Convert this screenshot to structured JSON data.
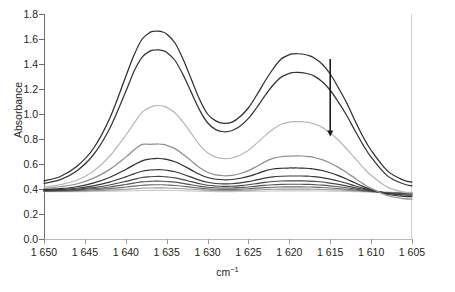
{
  "chart_data": {
    "type": "line",
    "title": "",
    "xlabel": "cm−1",
    "ylabel": "Absorbance",
    "xlim": [
      1650,
      1605
    ],
    "ylim": [
      0.0,
      1.8
    ],
    "x_reversed": true,
    "grid": false,
    "legend": null,
    "x_ticks": [
      1650,
      1645,
      1640,
      1635,
      1630,
      1625,
      1620,
      1615,
      1610,
      1605
    ],
    "x_tick_labels": [
      "1 650",
      "1 645",
      "1 640",
      "1 635",
      "1 630",
      "1 625",
      "1 620",
      "1 615",
      "1 610",
      "1 605"
    ],
    "y_ticks": [
      0.0,
      0.2,
      0.4,
      0.6,
      0.8,
      1.0,
      1.2,
      1.4,
      1.6,
      1.8
    ],
    "y_tick_labels": [
      "0.0",
      "0.2",
      "0.4",
      "0.6",
      "0.8",
      "1.0",
      "1.2",
      "1.4",
      "1.6",
      "1.8"
    ],
    "peak1_cm": 1636,
    "peak2_cm": 1618.5,
    "annotations": [
      {
        "name": "decreasing-arrow",
        "kind": "arrow",
        "x_cm": 1615.0,
        "y_from": 1.44,
        "y_to": 0.82,
        "direction": "down",
        "color": "#1a1a1a"
      }
    ],
    "x": [
      1650,
      1648,
      1646,
      1644,
      1642,
      1640,
      1639,
      1638,
      1637,
      1636.5,
      1636,
      1635.5,
      1635,
      1634,
      1633,
      1632,
      1631,
      1630,
      1629,
      1628,
      1627,
      1626,
      1625,
      1624,
      1623,
      1622,
      1621,
      1620,
      1619.5,
      1619,
      1618.5,
      1618,
      1617.5,
      1617,
      1616,
      1615,
      1614,
      1613,
      1612,
      1611,
      1610,
      1608,
      1606,
      1605
    ],
    "series": [
      {
        "name": "spectrum-1",
        "color": "#2e2e2e",
        "width": 1.25,
        "values": [
          0.465,
          0.5,
          0.58,
          0.72,
          0.96,
          1.3,
          1.47,
          1.6,
          1.655,
          1.662,
          1.663,
          1.656,
          1.64,
          1.57,
          1.44,
          1.28,
          1.12,
          1.0,
          0.945,
          0.925,
          0.935,
          0.98,
          1.05,
          1.15,
          1.26,
          1.36,
          1.44,
          1.475,
          1.481,
          1.482,
          1.48,
          1.474,
          1.465,
          1.45,
          1.4,
          1.32,
          1.21,
          1.09,
          0.95,
          0.82,
          0.71,
          0.545,
          0.47,
          0.455
        ]
      },
      {
        "name": "spectrum-2",
        "color": "#353535",
        "width": 1.25,
        "values": [
          0.445,
          0.475,
          0.545,
          0.67,
          0.88,
          1.18,
          1.34,
          1.455,
          1.505,
          1.512,
          1.513,
          1.507,
          1.493,
          1.43,
          1.315,
          1.175,
          1.035,
          0.93,
          0.875,
          0.858,
          0.868,
          0.905,
          0.965,
          1.05,
          1.145,
          1.23,
          1.295,
          1.325,
          1.332,
          1.333,
          1.331,
          1.326,
          1.318,
          1.305,
          1.26,
          1.19,
          1.095,
          0.99,
          0.87,
          0.755,
          0.655,
          0.505,
          0.44,
          0.425
        ]
      },
      {
        "name": "spectrum-3",
        "color": "#b8b8b8",
        "width": 1.25,
        "values": [
          0.415,
          0.435,
          0.47,
          0.54,
          0.66,
          0.83,
          0.925,
          1.015,
          1.055,
          1.066,
          1.068,
          1.064,
          1.053,
          1.01,
          0.935,
          0.845,
          0.755,
          0.69,
          0.655,
          0.643,
          0.648,
          0.672,
          0.71,
          0.765,
          0.825,
          0.878,
          0.918,
          0.935,
          0.939,
          0.94,
          0.939,
          0.936,
          0.931,
          0.922,
          0.893,
          0.848,
          0.79,
          0.722,
          0.648,
          0.575,
          0.51,
          0.415,
          0.375,
          0.368
        ]
      },
      {
        "name": "spectrum-4",
        "color": "#8f8f8f",
        "width": 1.25,
        "values": [
          0.405,
          0.418,
          0.44,
          0.485,
          0.555,
          0.655,
          0.712,
          0.757,
          0.757,
          0.759,
          0.76,
          0.757,
          0.75,
          0.723,
          0.678,
          0.625,
          0.572,
          0.534,
          0.513,
          0.506,
          0.509,
          0.524,
          0.547,
          0.58,
          0.617,
          0.645,
          0.658,
          0.663,
          0.664,
          0.665,
          0.664,
          0.662,
          0.659,
          0.653,
          0.635,
          0.608,
          0.573,
          0.532,
          0.487,
          0.443,
          0.405,
          0.348,
          0.323,
          0.318
        ]
      },
      {
        "name": "spectrum-5",
        "color": "#2f2f2f",
        "width": 1.25,
        "values": [
          0.395,
          0.403,
          0.418,
          0.447,
          0.492,
          0.556,
          0.593,
          0.625,
          0.64,
          0.643,
          0.644,
          0.642,
          0.637,
          0.618,
          0.588,
          0.553,
          0.518,
          0.492,
          0.478,
          0.474,
          0.476,
          0.486,
          0.501,
          0.522,
          0.545,
          0.56,
          0.566,
          0.568,
          0.568,
          0.568,
          0.567,
          0.566,
          0.564,
          0.56,
          0.548,
          0.53,
          0.507,
          0.48,
          0.45,
          0.421,
          0.396,
          0.358,
          0.341,
          0.338
        ]
      },
      {
        "name": "spectrum-6",
        "color": "#3a3a3a",
        "width": 1.2,
        "values": [
          0.39,
          0.396,
          0.406,
          0.425,
          0.455,
          0.497,
          0.521,
          0.542,
          0.552,
          0.554,
          0.555,
          0.554,
          0.55,
          0.538,
          0.518,
          0.495,
          0.471,
          0.454,
          0.444,
          0.441,
          0.442,
          0.449,
          0.459,
          0.473,
          0.487,
          0.497,
          0.502,
          0.504,
          0.504,
          0.504,
          0.504,
          0.503,
          0.502,
          0.499,
          0.491,
          0.479,
          0.464,
          0.446,
          0.426,
          0.407,
          0.39,
          0.364,
          0.352,
          0.35
        ]
      },
      {
        "name": "spectrum-7",
        "color": "#474747",
        "width": 1.2,
        "values": [
          0.387,
          0.391,
          0.398,
          0.411,
          0.432,
          0.461,
          0.477,
          0.492,
          0.498,
          0.5,
          0.501,
          0.5,
          0.497,
          0.489,
          0.475,
          0.459,
          0.443,
          0.43,
          0.424,
          0.421,
          0.422,
          0.427,
          0.434,
          0.443,
          0.453,
          0.46,
          0.464,
          0.465,
          0.465,
          0.465,
          0.465,
          0.464,
          0.463,
          0.461,
          0.456,
          0.447,
          0.437,
          0.425,
          0.411,
          0.398,
          0.386,
          0.368,
          0.36,
          0.358
        ]
      },
      {
        "name": "spectrum-8",
        "color": "#565656",
        "width": 1.15,
        "values": [
          0.385,
          0.388,
          0.393,
          0.402,
          0.416,
          0.436,
          0.447,
          0.457,
          0.461,
          0.463,
          0.463,
          0.462,
          0.46,
          0.455,
          0.445,
          0.434,
          0.423,
          0.414,
          0.41,
          0.408,
          0.408,
          0.412,
          0.416,
          0.423,
          0.429,
          0.434,
          0.437,
          0.438,
          0.438,
          0.438,
          0.438,
          0.437,
          0.437,
          0.435,
          0.431,
          0.425,
          0.418,
          0.41,
          0.4,
          0.39,
          0.382,
          0.369,
          0.363,
          0.362
        ]
      },
      {
        "name": "spectrum-9",
        "color": "#6c6c6c",
        "width": 1.15,
        "values": [
          0.383,
          0.385,
          0.388,
          0.394,
          0.403,
          0.416,
          0.423,
          0.43,
          0.433,
          0.434,
          0.434,
          0.434,
          0.432,
          0.428,
          0.422,
          0.415,
          0.407,
          0.401,
          0.398,
          0.397,
          0.397,
          0.399,
          0.402,
          0.407,
          0.411,
          0.414,
          0.416,
          0.417,
          0.417,
          0.417,
          0.417,
          0.416,
          0.416,
          0.415,
          0.412,
          0.408,
          0.403,
          0.398,
          0.392,
          0.385,
          0.379,
          0.37,
          0.366,
          0.365
        ]
      },
      {
        "name": "spectrum-10",
        "color": "#9a9a9a",
        "width": 1.1,
        "values": [
          0.38,
          0.381,
          0.383,
          0.386,
          0.391,
          0.398,
          0.402,
          0.406,
          0.408,
          0.409,
          0.409,
          0.409,
          0.408,
          0.405,
          0.402,
          0.398,
          0.394,
          0.39,
          0.388,
          0.387,
          0.387,
          0.389,
          0.391,
          0.393,
          0.396,
          0.398,
          0.399,
          0.399,
          0.399,
          0.399,
          0.399,
          0.399,
          0.399,
          0.398,
          0.396,
          0.394,
          0.392,
          0.389,
          0.385,
          0.382,
          0.378,
          0.373,
          0.37,
          0.37
        ]
      },
      {
        "name": "spectrum-11",
        "color": "#c9c9c9",
        "width": 1.1,
        "values": [
          0.378,
          0.378,
          0.379,
          0.38,
          0.382,
          0.385,
          0.386,
          0.388,
          0.389,
          0.389,
          0.389,
          0.389,
          0.389,
          0.388,
          0.386,
          0.384,
          0.382,
          0.38,
          0.379,
          0.379,
          0.379,
          0.38,
          0.381,
          0.382,
          0.383,
          0.384,
          0.385,
          0.385,
          0.385,
          0.385,
          0.385,
          0.385,
          0.385,
          0.384,
          0.384,
          0.383,
          0.382,
          0.38,
          0.379,
          0.377,
          0.376,
          0.374,
          0.373,
          0.373
        ]
      }
    ]
  }
}
